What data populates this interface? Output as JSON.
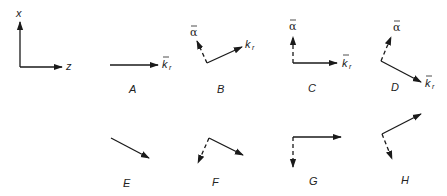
{
  "axes": {
    "vertical_label": "x",
    "horizontal_label": "z"
  },
  "vector_labels": {
    "alpha": "α",
    "k": "k",
    "k_sub": "r"
  },
  "panels": [
    {
      "id": "A",
      "label": "A"
    },
    {
      "id": "B",
      "label": "B"
    },
    {
      "id": "C",
      "label": "C"
    },
    {
      "id": "D",
      "label": "D"
    },
    {
      "id": "E",
      "label": "E"
    },
    {
      "id": "F",
      "label": "F"
    },
    {
      "id": "G",
      "label": "G"
    },
    {
      "id": "H",
      "label": "H"
    }
  ]
}
